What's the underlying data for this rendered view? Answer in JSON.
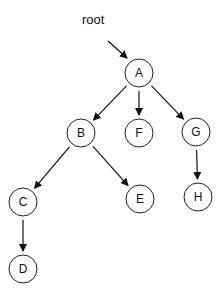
{
  "diagram": {
    "type": "tree",
    "root_label": "root",
    "nodes": [
      {
        "id": "A",
        "label": "A",
        "x": 139,
        "y": 73
      },
      {
        "id": "B",
        "label": "B",
        "x": 81,
        "y": 133
      },
      {
        "id": "F",
        "label": "F",
        "x": 139,
        "y": 133
      },
      {
        "id": "G",
        "label": "G",
        "x": 196,
        "y": 132
      },
      {
        "id": "C",
        "label": "C",
        "x": 23,
        "y": 202
      },
      {
        "id": "E",
        "label": "E",
        "x": 140,
        "y": 199
      },
      {
        "id": "H",
        "label": "H",
        "x": 198,
        "y": 197
      },
      {
        "id": "D",
        "label": "D",
        "x": 23,
        "y": 269
      }
    ],
    "edges": [
      {
        "from": "A",
        "to": "B"
      },
      {
        "from": "A",
        "to": "F"
      },
      {
        "from": "A",
        "to": "G"
      },
      {
        "from": "B",
        "to": "C"
      },
      {
        "from": "B",
        "to": "E"
      },
      {
        "from": "G",
        "to": "H"
      },
      {
        "from": "C",
        "to": "D"
      }
    ]
  }
}
